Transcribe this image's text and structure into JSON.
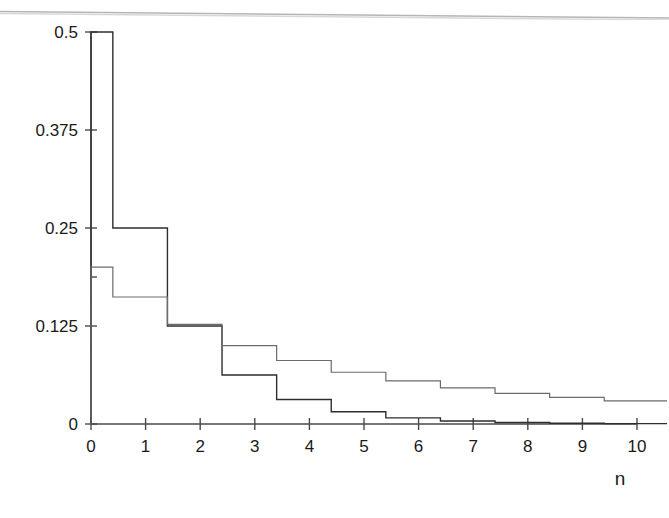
{
  "chart_data": {
    "type": "line",
    "title": "",
    "subtitle": "",
    "xlabel": "n",
    "ylabel": "",
    "xlim": [
      -0.1,
      10.6
    ],
    "ylim": [
      0,
      0.52
    ],
    "grid": false,
    "legend": "none",
    "style": "step-post",
    "step_offset": 0.4,
    "x_ticks": [
      0,
      1,
      2,
      3,
      4,
      5,
      6,
      7,
      8,
      9,
      10
    ],
    "x_tick_labels": [
      "0",
      "1",
      "2",
      "3",
      "4",
      "5",
      "6",
      "7",
      "8",
      "9",
      "10"
    ],
    "y_ticks": [
      0,
      0.125,
      0.1875,
      0.25,
      0.375,
      0.5
    ],
    "y_tick_labels": [
      "0",
      "0.125",
      "",
      "0.25",
      "0.375",
      "0.5"
    ],
    "y_labeled_ticks": [
      "0",
      "0.125",
      "0.25",
      "0.375",
      "0.5"
    ],
    "x": [
      0,
      1,
      2,
      3,
      4,
      5,
      6,
      7,
      8,
      9,
      10
    ],
    "series": [
      {
        "name": "steep-distribution",
        "color": "#2e2e2e",
        "line_width": 1.4,
        "values": [
          0.5,
          0.25,
          0.125,
          0.0625,
          0.0312,
          0.0156,
          0.0078,
          0.0039,
          0.002,
          0.001,
          0.0005
        ]
      },
      {
        "name": "flat-distribution",
        "color": "#6b6b6b",
        "line_width": 1.2,
        "values": [
          0.2,
          0.162,
          0.127,
          0.1,
          0.081,
          0.066,
          0.055,
          0.046,
          0.039,
          0.034,
          0.0295
        ]
      }
    ]
  },
  "axis": {
    "x_title": "n",
    "y_title": ""
  },
  "figure": {
    "caption": "",
    "background": "#ffffff",
    "page_edge_color": "#b8b8b8"
  }
}
